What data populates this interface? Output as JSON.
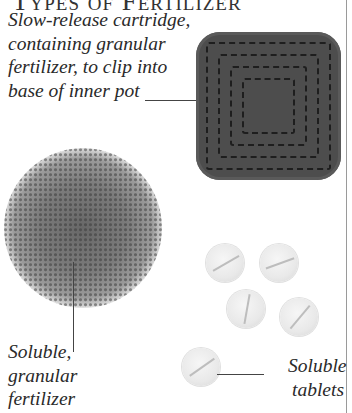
{
  "page": {
    "title": "Types of Fertilizer"
  },
  "items": [
    {
      "id": "cartridge",
      "caption": "Slow-release cartridge, containing granular fertilizer, to clip into base of inner pot"
    },
    {
      "id": "granular",
      "caption": "Soluble, granular fertilizer"
    },
    {
      "id": "tablets",
      "caption": "Soluble tablets"
    }
  ],
  "illustrations": {
    "cartridge_color": "#4d4d4d",
    "granules_color": "#7c7c7c",
    "tablet_color": "#ececec",
    "tablet_count": 5
  }
}
